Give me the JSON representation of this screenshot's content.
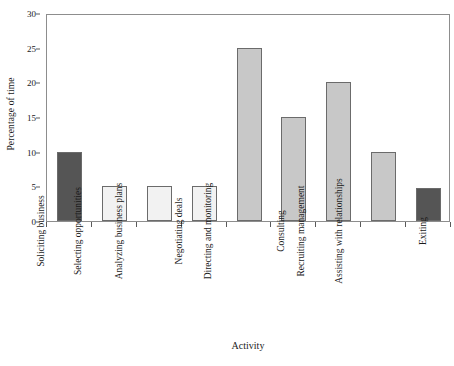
{
  "chart_data": {
    "type": "bar",
    "title": "",
    "xlabel": "Activity",
    "ylabel": "Percentage of time",
    "categories": [
      "Soliciting business",
      "Selecting opportunities",
      "Analyzing business plans",
      "Negotiating deals",
      "Directing and monitoring",
      "Consulting",
      "Recruiting management",
      "Assisting with relationships",
      "Exiting"
    ],
    "values": [
      10,
      5,
      5,
      5,
      25,
      15,
      20,
      10,
      4.8
    ],
    "bar_colors": [
      "#555555",
      "#f2f2f2",
      "#f2f2f2",
      "#f2f2f2",
      "#c8c8c8",
      "#c8c8c8",
      "#c8c8c8",
      "#c8c8c8",
      "#555555"
    ],
    "bar_edge_color": "#6b6b6b",
    "ylim": [
      0,
      30
    ],
    "y_ticks": [
      0,
      5,
      10,
      15,
      20,
      25,
      30
    ],
    "y_tick_labels": [
      "0",
      "5",
      "10",
      "15",
      "20",
      "25",
      "30"
    ],
    "grid": false,
    "legend": "none",
    "frame": true,
    "axis_color": "#8d8d8d",
    "background": "#ffffff"
  }
}
